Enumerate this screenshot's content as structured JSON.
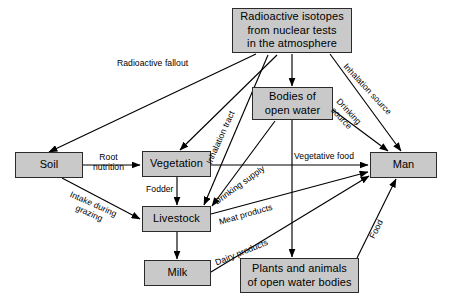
{
  "diagram": {
    "type": "flow-diagram",
    "box_fill_color": "#c9c9c9",
    "box_border_color": "#2b2b2b",
    "line_color": "#000000",
    "background_color": "#ffffff",
    "nodes": [
      {
        "id": "isotopes",
        "label": "Radioactive isotopes\nfrom nuclear tests\nin the atmosphere",
        "x": 232,
        "y": 8,
        "w": 120,
        "h": 45
      },
      {
        "id": "water",
        "label": "Bodies of\nopen water",
        "x": 252,
        "y": 87,
        "w": 81,
        "h": 33
      },
      {
        "id": "soil",
        "label": "Soil",
        "x": 15,
        "y": 152,
        "w": 68,
        "h": 26
      },
      {
        "id": "vegetation",
        "label": "Vegetation",
        "x": 142,
        "y": 151,
        "w": 69,
        "h": 26
      },
      {
        "id": "man",
        "label": "Man",
        "x": 370,
        "y": 152,
        "w": 67,
        "h": 26
      },
      {
        "id": "livestock",
        "label": "Livestock",
        "x": 142,
        "y": 206,
        "w": 69,
        "h": 26
      },
      {
        "id": "milk",
        "label": "Milk",
        "x": 144,
        "y": 260,
        "w": 67,
        "h": 26
      },
      {
        "id": "plants_animals",
        "label": "Plants and animals\nof open water bodies",
        "x": 240,
        "y": 258,
        "w": 119,
        "h": 35
      }
    ],
    "edge_labels": [
      {
        "id": "fallout",
        "text": "Radioactive fallout",
        "x": 117,
        "y": 59,
        "rotate": 0
      },
      {
        "id": "inhalation_source",
        "text": "Inhalation source",
        "x": 348,
        "y": 62,
        "rotate": 47
      },
      {
        "id": "inhalation_tract",
        "text": "Inhalation tract",
        "x": 205,
        "y": 162,
        "rotate": -66
      },
      {
        "id": "drinking_source",
        "text": "Drinking\nsource",
        "x": 341,
        "y": 97,
        "rotate": 47
      },
      {
        "id": "root_nutrition",
        "text": "Root\nnutrition",
        "x": 93,
        "y": 153,
        "rotate": 0
      },
      {
        "id": "drinking_supply",
        "text": "Drinking supply",
        "x": 213,
        "y": 199,
        "rotate": -36
      },
      {
        "id": "vegetative_food",
        "text": "Vegetative food",
        "x": 294,
        "y": 152,
        "rotate": 0
      },
      {
        "id": "fodder",
        "text": "Fodder",
        "x": 146,
        "y": 185,
        "rotate": 0
      },
      {
        "id": "intake_grazing",
        "text": "Intake during\ngrazing",
        "x": 72,
        "y": 190,
        "rotate": 24
      },
      {
        "id": "meat_products",
        "text": "Meat products",
        "x": 218,
        "y": 218,
        "rotate": -16
      },
      {
        "id": "dairy_products",
        "text": "Dairy products",
        "x": 214,
        "y": 259,
        "rotate": -22
      },
      {
        "id": "food",
        "text": "Food",
        "x": 368,
        "y": 236,
        "rotate": -63
      }
    ]
  }
}
